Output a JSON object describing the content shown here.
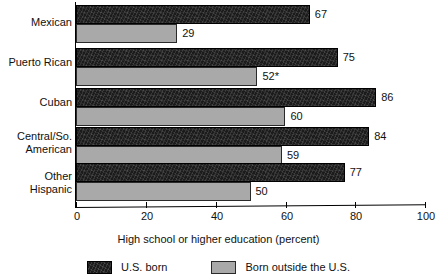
{
  "chart_data": {
    "type": "bar",
    "orientation": "horizontal",
    "title": "",
    "xlabel": "High school or higher education (percent)",
    "ylabel": "",
    "xlim": [
      0,
      100
    ],
    "xticks": [
      0,
      20,
      40,
      60,
      80,
      100
    ],
    "xtick_labels": [
      "0",
      "20",
      "40",
      "60",
      "80",
      "100"
    ],
    "grid": false,
    "legend_position": "bottom",
    "categories": [
      "Mexican",
      "Puerto Rican",
      "Cuban",
      "Central/So.\nAmerican",
      "Other\nHispanic"
    ],
    "series": [
      {
        "name": "U.S. born",
        "color": "#1b1b1b",
        "values": [
          67,
          75,
          86,
          84,
          77
        ],
        "value_labels": [
          "67",
          "75",
          "86",
          "84",
          "77"
        ]
      },
      {
        "name": "Born outside the U.S.",
        "color": "#a9a9a9",
        "values": [
          29,
          52,
          60,
          59,
          50
        ],
        "value_labels": [
          "29",
          "52*",
          "60",
          "59",
          "50"
        ]
      }
    ],
    "annotations": [
      "* asterisk on Puerto Rican born-outside-the-U.S. value"
    ]
  },
  "axis": {
    "x_title": "High school or higher education (percent)",
    "ticks": [
      {
        "value": 0,
        "label": "0"
      },
      {
        "value": 20,
        "label": "20"
      },
      {
        "value": 40,
        "label": "40"
      },
      {
        "value": 60,
        "label": "60"
      },
      {
        "value": 80,
        "label": "80"
      },
      {
        "value": 100,
        "label": "100"
      }
    ]
  },
  "categories": [
    {
      "label": "Mexican"
    },
    {
      "label": "Puerto Rican"
    },
    {
      "label": "Cuban"
    },
    {
      "label": "Central/So.\nAmerican"
    },
    {
      "label": "Other\nHispanic"
    }
  ],
  "bars": [
    {
      "category": "Mexican",
      "dark_value": 67,
      "dark_label": "67",
      "light_value": 29,
      "light_label": "29"
    },
    {
      "category": "Puerto Rican",
      "dark_value": 75,
      "dark_label": "75",
      "light_value": 52,
      "light_label": "52*"
    },
    {
      "category": "Cuban",
      "dark_value": 86,
      "dark_label": "86",
      "light_value": 60,
      "light_label": "60"
    },
    {
      "category": "Central/So. American",
      "dark_value": 84,
      "dark_label": "84",
      "light_value": 59,
      "light_label": "59"
    },
    {
      "category": "Other Hispanic",
      "dark_value": 77,
      "dark_label": "77",
      "light_value": 50,
      "light_label": "50"
    }
  ],
  "legend": {
    "items": [
      {
        "label": "U.S. born",
        "color": "#1b1b1b"
      },
      {
        "label": "Born outside the U.S.",
        "color": "#a9a9a9"
      }
    ]
  }
}
